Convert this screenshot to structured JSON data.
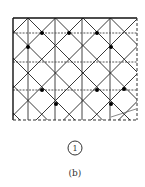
{
  "figure": {
    "type": "lattice-grid-diagram",
    "grid": {
      "columns": [
        "c0",
        "c1",
        "c2",
        "c3",
        "c4",
        "c5"
      ],
      "rows": [
        "r0",
        "r1",
        "r2",
        "r3"
      ],
      "diagonal_pattern": "diamond (45-degree lattice)",
      "edges": {
        "top": "solid",
        "left": "solid",
        "right": "dashed",
        "bottom": "dashed"
      }
    },
    "nodes": [
      {
        "col": 1,
        "row": 0
      },
      {
        "col": 2,
        "row": 0
      },
      {
        "col": 3,
        "row": 0
      },
      {
        "col": 0.5,
        "row": 0.5
      },
      {
        "col": 3.5,
        "row": 0.5
      },
      {
        "col": 1,
        "row": 2
      },
      {
        "col": 3,
        "row": 2
      },
      {
        "col": 4,
        "row": 2
      },
      {
        "col": 1.5,
        "row": 2.5
      },
      {
        "col": 3.5,
        "row": 2.5
      }
    ],
    "marker_label": "1",
    "caption": "(b)"
  }
}
